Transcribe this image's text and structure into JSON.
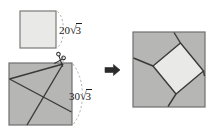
{
  "figure": {
    "background": "#ffffff",
    "width": 214,
    "height": 131
  },
  "colors": {
    "light_square_fill": "#e9e9e7",
    "dark_square_fill": "#b6b6b4",
    "outline": "#6f6f6f",
    "cut_line": "#3a3a3a",
    "dashed_arc": "#9a9a9a",
    "arrow": "#2b2b2b",
    "text": "#1a1a1a"
  },
  "labels": {
    "small_square": {
      "coefficient": "20",
      "radical_symbol": "√",
      "radicand": "3",
      "full": "20√3"
    },
    "large_square": {
      "coefficient": "30",
      "radical_symbol": "√",
      "radicand": "3",
      "full": "30√3"
    }
  },
  "shapes": {
    "small_square": {
      "x": 20,
      "y": 11,
      "size": 36,
      "fill": "#e9e9e7"
    },
    "large_square": {
      "x": 9,
      "y": 63,
      "size": 63,
      "fill": "#b6b6b4"
    },
    "result_square": {
      "x": 133,
      "y": 32,
      "size": 72,
      "fill": "#b6b6b4"
    },
    "result_inner_square": {
      "fill": "#e9e9e7",
      "rotated": "true"
    }
  },
  "icons": {
    "scissors": "scissors-icon",
    "arrow": "right-arrow-icon"
  }
}
